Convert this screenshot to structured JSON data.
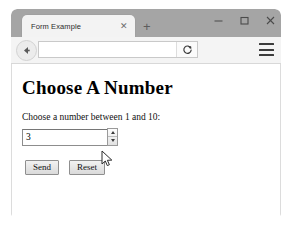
{
  "window": {
    "tab": {
      "title": "Form Example",
      "close_icon": "close-icon",
      "newtab_icon": "plus-icon",
      "newtab_label": "+"
    },
    "controls": {
      "minimize_icon": "minimize-icon",
      "maximize_icon": "maximize-icon",
      "close_icon": "window-close-icon"
    }
  },
  "toolbar": {
    "back_icon": "back-arrow-icon",
    "address_value": "",
    "address_placeholder": "",
    "reload_icon": "reload-icon",
    "menu_icon": "hamburger-menu-icon"
  },
  "page": {
    "heading": "Choose A Number",
    "label": "Choose a number between 1 and 10:",
    "number_input": {
      "value": "3",
      "spinner_up_icon": "spinner-up-arrow-icon",
      "spinner_down_icon": "spinner-down-arrow-icon"
    },
    "buttons": {
      "submit_label": "Send",
      "reset_label": "Reset"
    }
  },
  "cursor": {
    "icon": "mouse-pointer-icon"
  },
  "colors": {
    "titlebar": "#a5a5a5",
    "tab_active": "#f3f3f3",
    "toolbar": "#f4f4f4",
    "content": "#ffffff",
    "border": "#dcdcdc"
  }
}
